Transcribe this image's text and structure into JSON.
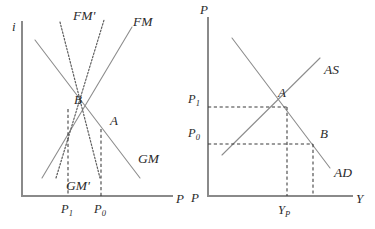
{
  "figure": {
    "background_color": "#ffffff",
    "axis_color": "#8a8a8a",
    "curve_color": "#8d8d8d",
    "dotted_curve_color": "#5d5d5d",
    "guide_color": "#3a3a3a",
    "text_color": "#2b2b2b"
  },
  "left_panel": {
    "name": "money-market-panel",
    "y_axis_label": "i",
    "x_axis_label": "P",
    "curves": [
      {
        "id": "fm",
        "label": "FM",
        "style": "solid",
        "slope": "upward"
      },
      {
        "id": "fm_prime",
        "label": "FM'",
        "style": "dotted",
        "slope": "upward"
      },
      {
        "id": "gm",
        "label": "GM",
        "style": "solid",
        "slope": "downward"
      },
      {
        "id": "gm_prime",
        "label": "GM'",
        "style": "dotted",
        "slope": "downward"
      }
    ],
    "points": [
      {
        "id": "point-a",
        "label": "A",
        "x_tick": "P0"
      },
      {
        "id": "point-b",
        "label": "B",
        "x_tick": "P1"
      }
    ],
    "x_ticks": [
      {
        "id": "p1",
        "base": "P",
        "sub": "1"
      },
      {
        "id": "p0",
        "base": "P",
        "sub": "0"
      }
    ]
  },
  "right_panel": {
    "name": "as-ad-panel",
    "y_axis_label": "P",
    "x_axis_label": "Y",
    "origin_label": "P",
    "curves": [
      {
        "id": "as",
        "label": "AS",
        "style": "solid",
        "slope": "upward"
      },
      {
        "id": "ad",
        "label": "AD",
        "style": "solid",
        "slope": "downward"
      }
    ],
    "points": [
      {
        "id": "point-a",
        "label": "A"
      },
      {
        "id": "point-b",
        "label": "B"
      }
    ],
    "y_ticks": [
      {
        "id": "p1",
        "base": "P",
        "sub": "1"
      },
      {
        "id": "p0",
        "base": "P",
        "sub": "0"
      }
    ],
    "x_ticks": [
      {
        "id": "yp",
        "base": "Y",
        "sub": "P"
      }
    ]
  },
  "chart_data": {
    "type": "line",
    "panels": [
      {
        "name": "left",
        "xlabel": "P",
        "ylabel": "i",
        "series": [
          {
            "name": "FM",
            "style": "solid",
            "x": [
              0.18,
              0.86
            ],
            "y": [
              0.08,
              0.82
            ]
          },
          {
            "name": "FM'",
            "style": "dotted",
            "x": [
              0.04,
              0.62
            ],
            "y": [
              0.05,
              0.9
            ]
          },
          {
            "name": "GM",
            "style": "solid",
            "x": [
              0.02,
              0.78
            ],
            "y": [
              0.86,
              0.08
            ]
          },
          {
            "name": "GM'",
            "style": "dotted",
            "x": [
              0.24,
              0.56
            ],
            "y": [
              0.94,
              0.03
            ]
          }
        ],
        "annotations": [
          {
            "label": "A",
            "x": 0.62,
            "y": 0.46
          },
          {
            "label": "B",
            "x": 0.32,
            "y": 0.58
          }
        ],
        "xticks": [
          "P1",
          "P0"
        ],
        "xtick_positions": [
          0.32,
          0.62
        ]
      },
      {
        "name": "right",
        "xlabel": "Y",
        "ylabel": "P",
        "series": [
          {
            "name": "AS",
            "style": "solid",
            "x": [
              0.05,
              0.88
            ],
            "y": [
              0.18,
              0.78
            ]
          },
          {
            "name": "AD",
            "style": "solid",
            "x": [
              0.14,
              0.9
            ],
            "y": [
              0.94,
              0.1
            ]
          }
        ],
        "annotations": [
          {
            "label": "A",
            "x": 0.46,
            "y": 0.62
          },
          {
            "label": "B",
            "x": 0.74,
            "y": 0.37
          }
        ],
        "yticks": [
          "P1",
          "P0"
        ],
        "ytick_positions": [
          0.62,
          0.37
        ],
        "xticks": [
          "YP"
        ],
        "xtick_positions": [
          0.46
        ]
      }
    ]
  }
}
